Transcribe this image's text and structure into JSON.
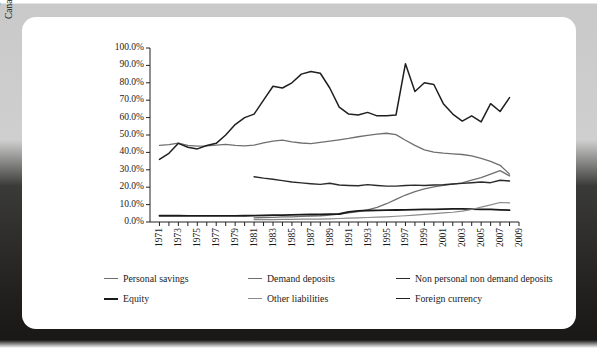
{
  "chart_data": {
    "type": "line",
    "title": "",
    "xlabel": "",
    "ylabel": "Percentage of total Canadian dollar liabilities",
    "ylabel_lines": [
      "Percentage of total",
      "Canadian dollar liabilities"
    ],
    "ylim": [
      0,
      100
    ],
    "ytick_values": [
      0,
      10,
      20,
      30,
      40,
      50,
      60,
      70,
      80,
      90,
      100
    ],
    "ytick_labels": [
      "0.0%",
      "10.0%",
      "20.0%",
      "30.0%",
      "40.0%",
      "50.0%",
      "60.0%",
      "70.0%",
      "80.0%",
      "90.0%",
      "100.0%"
    ],
    "xlim": [
      1970,
      2009
    ],
    "x_all": [
      1970,
      1971,
      1972,
      1973,
      1974,
      1975,
      1976,
      1977,
      1978,
      1979,
      1980,
      1981,
      1982,
      1983,
      1984,
      1985,
      1986,
      1987,
      1988,
      1989,
      1990,
      1991,
      1992,
      1993,
      1994,
      1995,
      1996,
      1997,
      1998,
      1999,
      2000,
      2001,
      2002,
      2003,
      2004,
      2005,
      2006,
      2007,
      2008,
      2009
    ],
    "xtick_values": [
      1971,
      1973,
      1975,
      1977,
      1979,
      1981,
      1983,
      1985,
      1987,
      1989,
      1991,
      1993,
      1995,
      1997,
      1999,
      2001,
      2003,
      2005,
      2007,
      2009
    ],
    "xtick_labels": [
      "1971",
      "1973",
      "1975",
      "1977",
      "1979",
      "1981",
      "1983",
      "1985",
      "1987",
      "1989",
      "1991",
      "1993",
      "1995",
      "1997",
      "1999",
      "2001",
      "2003",
      "2005",
      "2007",
      "2009"
    ],
    "grid": false,
    "legend_position": "bottom",
    "series": [
      {
        "name": "Personal savings",
        "color": "#6f6f6f",
        "width": 1.3,
        "x_start": 1971,
        "x": [
          1971,
          1972,
          1973,
          1974,
          1975,
          1976,
          1977,
          1978,
          1979,
          1980,
          1981,
          1982,
          1983,
          1984,
          1985,
          1986,
          1987,
          1988,
          1989,
          1990,
          1991,
          1992,
          1993,
          1994,
          1995,
          1996,
          1997,
          1998,
          1999,
          2000,
          2001,
          2002,
          2003,
          2004,
          2005,
          2006,
          2007,
          2008
        ],
        "values": [
          44.0,
          44.5,
          45.3,
          44.0,
          43.6,
          43.8,
          44.2,
          44.6,
          44.0,
          43.8,
          44.2,
          45.5,
          46.5,
          47.0,
          46.0,
          45.4,
          45.0,
          45.8,
          46.5,
          47.2,
          48.0,
          49.0,
          49.8,
          50.5,
          51.0,
          50.2,
          47.0,
          44.0,
          41.5,
          40.2,
          39.6,
          39.2,
          38.8,
          38.0,
          36.5,
          34.8,
          32.6,
          27.5
        ]
      },
      {
        "name": "Demand deposits",
        "color": "#6f6f6f",
        "width": 1.3,
        "x_start": 1981,
        "x": [
          1981,
          1982,
          1983,
          1984,
          1985,
          1986,
          1987,
          1988,
          1989,
          1990,
          1991,
          1992,
          1993,
          1994,
          1995,
          1996,
          1997,
          1998,
          1999,
          2000,
          2001,
          2002,
          2003,
          2004,
          2005,
          2006,
          2007,
          2008
        ],
        "values": [
          2.4,
          2.6,
          2.7,
          2.9,
          3.0,
          3.2,
          3.4,
          3.6,
          4.0,
          4.6,
          5.2,
          6.0,
          7.0,
          8.4,
          10.5,
          13.0,
          15.5,
          17.5,
          19.0,
          20.2,
          21.0,
          21.8,
          22.5,
          24.0,
          25.5,
          27.5,
          29.5,
          26.5
        ]
      },
      {
        "name": "Non personal non demand deposits",
        "color": "#2a2a2a",
        "width": 1.4,
        "x_start": 1981,
        "x": [
          1981,
          1982,
          1983,
          1984,
          1985,
          1986,
          1987,
          1988,
          1989,
          1990,
          1991,
          1992,
          1993,
          1994,
          1995,
          1996,
          1997,
          1998,
          1999,
          2000,
          2001,
          2002,
          2003,
          2004,
          2005,
          2006,
          2007,
          2008
        ],
        "values": [
          26.0,
          25.2,
          24.6,
          23.8,
          23.0,
          22.5,
          22.0,
          21.6,
          22.3,
          21.3,
          21.0,
          20.8,
          21.5,
          21.0,
          20.6,
          20.6,
          21.0,
          21.2,
          21.0,
          21.3,
          21.4,
          21.8,
          22.2,
          22.6,
          23.0,
          22.6,
          24.0,
          23.6
        ]
      },
      {
        "name": "Equity",
        "color": "#1a1a1a",
        "width": 1.8,
        "x_start": 1971,
        "x": [
          1971,
          1972,
          1973,
          1974,
          1975,
          1976,
          1977,
          1978,
          1979,
          1980,
          1981,
          1982,
          1983,
          1984,
          1985,
          1986,
          1987,
          1988,
          1989,
          1990,
          1991,
          1992,
          1993,
          1994,
          1995,
          1996,
          1997,
          1998,
          1999,
          2000,
          2001,
          2002,
          2003,
          2004,
          2005,
          2006,
          2007,
          2008
        ],
        "values": [
          3.6,
          3.6,
          3.6,
          3.5,
          3.5,
          3.5,
          3.5,
          3.5,
          3.5,
          3.6,
          3.7,
          3.8,
          3.9,
          4.0,
          4.1,
          4.2,
          4.3,
          4.4,
          4.5,
          4.6,
          5.8,
          6.4,
          6.6,
          6.7,
          6.8,
          6.9,
          7.0,
          7.1,
          7.2,
          7.3,
          7.4,
          7.5,
          7.5,
          7.4,
          7.3,
          7.2,
          7.0,
          6.8
        ]
      },
      {
        "name": "Other liabilities",
        "color": "#8a8a8a",
        "width": 1.2,
        "x_start": 1981,
        "x": [
          1981,
          1982,
          1983,
          1984,
          1985,
          1986,
          1987,
          1988,
          1989,
          1990,
          1991,
          1992,
          1993,
          1994,
          1995,
          1996,
          1997,
          1998,
          1999,
          2000,
          2001,
          2002,
          2003,
          2004,
          2005,
          2006,
          2007,
          2008
        ],
        "values": [
          1.4,
          1.4,
          1.4,
          1.5,
          1.5,
          1.6,
          1.6,
          1.7,
          1.8,
          2.0,
          2.2,
          2.4,
          2.6,
          2.8,
          3.0,
          3.3,
          3.6,
          4.0,
          4.4,
          4.8,
          5.2,
          5.6,
          6.2,
          7.2,
          8.6,
          9.8,
          11.2,
          11.0
        ]
      },
      {
        "name": "Foreign currency",
        "color": "#1f1f1f",
        "width": 1.5,
        "x_start": 1971,
        "x": [
          1971,
          1972,
          1973,
          1974,
          1975,
          1976,
          1977,
          1978,
          1979,
          1980,
          1981,
          1982,
          1983,
          1984,
          1985,
          1986,
          1987,
          1988,
          1989,
          1990,
          1991,
          1992,
          1993,
          1994,
          1995,
          1996,
          1997,
          1998,
          1999,
          2000,
          2001,
          2002,
          2003,
          2004,
          2005,
          2006,
          2007,
          2008
        ],
        "values": [
          36.0,
          39.5,
          45.2,
          43.0,
          42.0,
          44.0,
          45.2,
          50.0,
          56.0,
          60.0,
          62.0,
          70.0,
          78.0,
          77.0,
          80.0,
          85.0,
          86.5,
          85.5,
          77.0,
          66.0,
          62.0,
          61.5,
          63.0,
          61.0,
          61.0,
          61.5,
          91.0,
          75.0,
          80.0,
          79.0,
          68.0,
          62.0,
          58.0,
          61.0,
          57.5,
          68.0,
          63.5,
          71.5
        ]
      }
    ]
  },
  "legend": {
    "items": [
      {
        "label": "Personal savings",
        "color": "#6f6f6f",
        "weight": "1.3px"
      },
      {
        "label": "Demand deposits",
        "color": "#6f6f6f",
        "weight": "1.3px"
      },
      {
        "label": "Non personal non demand deposits",
        "color": "#2a2a2a",
        "weight": "1.5px"
      },
      {
        "label": "Equity",
        "color": "#1a1a1a",
        "weight": "2.2px"
      },
      {
        "label": "Other liabilities",
        "color": "#8a8a8a",
        "weight": "1.2px"
      },
      {
        "label": "Foreign currency",
        "color": "#1f1f1f",
        "weight": "1.8px"
      }
    ]
  }
}
